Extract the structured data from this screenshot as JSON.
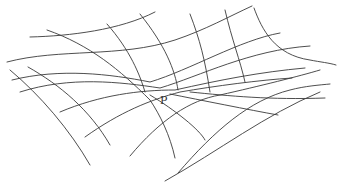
{
  "figure": {
    "type": "saddle-surface-grid",
    "point_label": "P",
    "line_color": "#3a3a3a",
    "background": "#ffffff"
  }
}
